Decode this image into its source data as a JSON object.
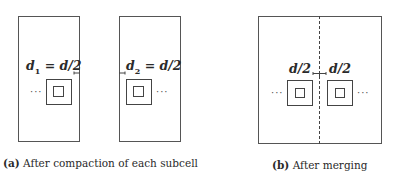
{
  "figure": {
    "panel_a": {
      "caption_tag": "(a)",
      "caption_text": "After compaction of each subcell",
      "left_subcell": {
        "label_var": "d",
        "label_sub": "1",
        "label_rest": " = d/2",
        "dots": "···"
      },
      "right_subcell": {
        "label_var": "d",
        "label_sub": "2",
        "label_rest": " = d/2",
        "dots": "···"
      }
    },
    "panel_b": {
      "caption_tag": "(b)",
      "caption_text": "After merging",
      "left_label": "d/2",
      "right_label": "d/2",
      "left_dots": "···",
      "right_dots": "···"
    },
    "colors": {
      "line": "#444444",
      "text": "#2a2a2a",
      "background": "#ffffff"
    }
  }
}
